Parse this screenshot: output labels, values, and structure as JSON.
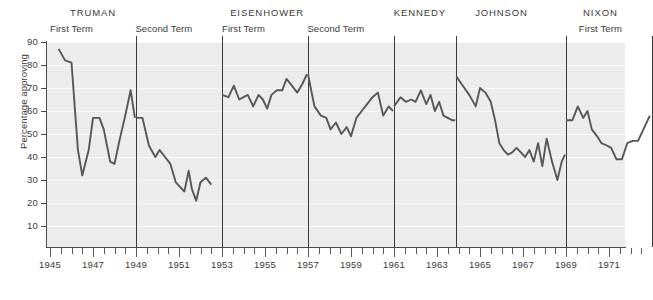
{
  "chart_data": {
    "type": "line",
    "title": "",
    "xlabel": "",
    "ylabel": "Percentage approving",
    "ylim": [
      0,
      90
    ],
    "xlim": [
      1945.0,
      1973.0
    ],
    "yticks": [
      10,
      20,
      30,
      40,
      50,
      60,
      70,
      80,
      90
    ],
    "xticks": [
      1945,
      1947,
      1949,
      1951,
      1953,
      1955,
      1957,
      1959,
      1961,
      1963,
      1965,
      1967,
      1969,
      1971
    ],
    "xtick_interval_years": 0.5,
    "grid": "horizontal",
    "legend": "none",
    "line_color": "#575757",
    "plot_background": "#ececec",
    "gridline_color": "#fbfbfb",
    "series": [
      {
        "name": "Presidential approval",
        "segments": [
          {
            "president": "TRUMAN",
            "term": "First Term",
            "x": [
              1945.4,
              1945.7,
              1946.0,
              1946.3,
              1946.5,
              1946.8,
              1947.0,
              1947.3,
              1947.5,
              1947.8,
              1948.0,
              1948.25,
              1948.5,
              1948.75,
              1948.95
            ],
            "y": [
              87,
              82,
              81,
              43,
              32,
              43,
              57,
              57,
              52,
              38,
              37,
              48,
              58,
              69,
              57
            ]
          },
          {
            "president": "TRUMAN",
            "term": "Second Term",
            "x": [
              1949.0,
              1949.3,
              1949.6,
              1949.9,
              1950.1,
              1950.35,
              1950.6,
              1950.85,
              1951.05,
              1951.25,
              1951.45,
              1951.6,
              1951.8,
              1952.0,
              1952.25,
              1952.5
            ],
            "y": [
              57,
              57,
              45,
              40,
              43,
              40,
              37,
              29,
              27,
              25,
              34,
              26,
              21,
              29,
              31,
              28
            ]
          },
          {
            "president": "EISENHOWER",
            "term": "First Term",
            "x": [
              1953.0,
              1953.3,
              1953.55,
              1953.8,
              1954.0,
              1954.2,
              1954.45,
              1954.7,
              1954.9,
              1955.1,
              1955.3,
              1955.55,
              1955.8,
              1956.0,
              1956.25,
              1956.5,
              1956.75,
              1956.95
            ],
            "y": [
              67,
              66,
              71,
              65,
              66,
              67,
              62,
              67,
              65,
              61,
              67,
              69,
              69,
              74,
              71,
              68,
              72,
              76
            ]
          },
          {
            "president": "EISENHOWER",
            "term": "Second Term",
            "x": [
              1957.0,
              1957.3,
              1957.6,
              1957.85,
              1958.05,
              1958.3,
              1958.55,
              1958.8,
              1959.0,
              1959.25,
              1959.5,
              1959.75,
              1960.0,
              1960.25,
              1960.5,
              1960.75,
              1960.95
            ],
            "y": [
              76,
              62,
              58,
              57,
              52,
              55,
              50,
              53,
              49,
              57,
              60,
              63,
              66,
              68,
              58,
              62,
              60
            ]
          },
          {
            "president": "KENNEDY",
            "term": "",
            "x": [
              1961.0,
              1961.3,
              1961.55,
              1961.8,
              1962.0,
              1962.25,
              1962.5,
              1962.7,
              1962.9,
              1963.1,
              1963.3,
              1963.5,
              1963.7,
              1963.85
            ],
            "y": [
              62,
              66,
              64,
              65,
              64,
              69,
              63,
              67,
              60,
              64,
              58,
              57,
              56,
              56
            ]
          },
          {
            "president": "JOHNSON",
            "term": "",
            "x": [
              1963.9,
              1964.2,
              1964.5,
              1964.8,
              1965.0,
              1965.25,
              1965.5,
              1965.7,
              1965.9,
              1966.1,
              1966.3,
              1966.5,
              1966.7,
              1966.9,
              1967.1,
              1967.3,
              1967.5,
              1967.7,
              1967.9,
              1968.1,
              1968.35,
              1968.6,
              1968.8,
              1968.95
            ],
            "y": [
              75,
              71,
              67,
              62,
              70,
              68,
              64,
              56,
              46,
              43,
              41,
              42,
              44,
              42,
              40,
              43,
              38,
              46,
              36,
              48,
              38,
              30,
              38,
              41
            ]
          },
          {
            "president": "NIXON",
            "term": "First Term",
            "x": [
              1969.0,
              1969.3,
              1969.55,
              1969.8,
              1970.0,
              1970.2,
              1970.45,
              1970.65,
              1970.9,
              1971.1,
              1971.35,
              1971.6,
              1971.85,
              1972.1,
              1972.35,
              1972.6,
              1972.9
            ],
            "y": [
              56,
              56,
              62,
              57,
              60,
              52,
              49,
              46,
              45,
              44,
              39,
              39,
              46,
              47,
              47,
              52,
              58
            ]
          }
        ]
      }
    ]
  },
  "presidents": [
    {
      "name": "TRUMAN",
      "name_x": 1947.0,
      "terms": [
        {
          "label": "First Term",
          "x": 1946.0
        },
        {
          "label": "Second Term",
          "x": 1950.3
        }
      ],
      "divider": 1949.0
    },
    {
      "name": "EISENHOWER",
      "name_x": 1955.1,
      "terms": [
        {
          "label": "First Term",
          "x": 1954.0
        },
        {
          "label": "Second Term",
          "x": 1958.3
        }
      ],
      "divider": 1953.0
    },
    {
      "name": "KENNEDY",
      "name_x": 1962.2,
      "terms": [],
      "divider": 1957.0
    },
    {
      "name": "JOHNSON",
      "name_x": 1966.0,
      "terms": [],
      "divider": 1961.0
    },
    {
      "name": "NIXON",
      "name_x": 1970.6,
      "terms": [
        {
          "label": "First Term",
          "x": 1970.6
        }
      ],
      "divider": 1963.9
    }
  ],
  "dividers": [
    1949.0,
    1953.0,
    1957.0,
    1961.0,
    1963.9,
    1969.0,
    1973.0
  ]
}
